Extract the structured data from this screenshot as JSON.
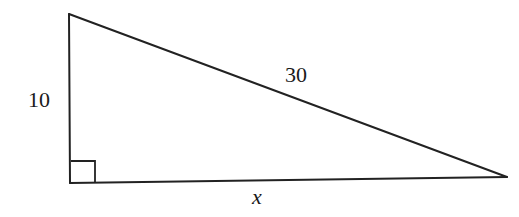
{
  "diagram": {
    "type": "right-triangle",
    "vertices": {
      "top": [
        69,
        14
      ],
      "right_angle": [
        70,
        183
      ],
      "right": [
        507,
        177
      ]
    },
    "right_angle_marker": {
      "corner": [
        70,
        183
      ],
      "size": 24
    },
    "labels": {
      "vertical_leg": "10",
      "hypotenuse": "30",
      "horizontal_leg": "x"
    },
    "colors": {
      "stroke": "#222222",
      "text": "#1a1a1a",
      "background": "#ffffff"
    }
  }
}
